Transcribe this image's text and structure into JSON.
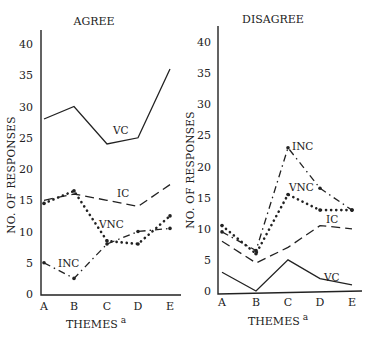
{
  "chart_data": [
    {
      "type": "line",
      "title": "AGREE",
      "xlabel": "THEMES",
      "xlabel_superscript": "a",
      "ylabel": "NO. OF RESPONSES",
      "categories": [
        "A",
        "B",
        "C",
        "D",
        "E"
      ],
      "yticks": [
        0,
        5,
        10,
        15,
        20,
        25,
        30,
        35,
        40
      ],
      "ylim": [
        0,
        42
      ],
      "grid": false,
      "series": [
        {
          "name": "VC",
          "style": "solid",
          "values": [
            28,
            30,
            24,
            25,
            36
          ]
        },
        {
          "name": "IC",
          "style": "dashed",
          "values": [
            15,
            16,
            15,
            14,
            17.5
          ]
        },
        {
          "name": "VNC",
          "style": "dotted",
          "values": [
            14.5,
            16.5,
            8.5,
            8,
            12.5
          ]
        },
        {
          "name": "INC",
          "style": "dash-dot",
          "values": [
            5,
            2.5,
            8,
            10,
            10.5
          ]
        }
      ]
    },
    {
      "type": "line",
      "title": "DISAGREE",
      "xlabel": "THEMES",
      "xlabel_superscript": "a",
      "ylabel": "NO. OF RESPONSES",
      "categories": [
        "A",
        "B",
        "C",
        "D",
        "E"
      ],
      "yticks": [
        0,
        5,
        10,
        15,
        20,
        25,
        30,
        35,
        40
      ],
      "ylim": [
        0,
        42
      ],
      "grid": false,
      "series": [
        {
          "name": "INC",
          "style": "dash-dot",
          "values": [
            9.5,
            6.5,
            23,
            16.5,
            13
          ]
        },
        {
          "name": "VNC",
          "style": "dotted",
          "values": [
            10.5,
            6,
            15.5,
            13,
            13
          ]
        },
        {
          "name": "IC",
          "style": "dashed",
          "values": [
            8,
            4.5,
            7,
            10.5,
            10
          ]
        },
        {
          "name": "VC",
          "style": "solid",
          "values": [
            3,
            0,
            5,
            2,
            1
          ]
        }
      ]
    }
  ],
  "left": {
    "title": "AGREE",
    "ylabel": "NO. OF RESPONSES",
    "xlabel": "THEMES",
    "sup": "a",
    "labels": {
      "vc": "VC",
      "ic": "IC",
      "vnc": "VNC",
      "inc": "INC"
    }
  },
  "right": {
    "title": "DISAGREE",
    "ylabel": "NO. OF RESPONSES",
    "xlabel": "THEMES",
    "sup": "a",
    "labels": {
      "inc": "INC",
      "vnc": "VNC",
      "ic": "IC",
      "vc": "VC"
    }
  }
}
